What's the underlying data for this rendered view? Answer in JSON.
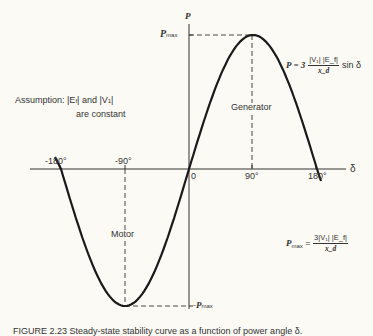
{
  "axes": {
    "y_label": "P",
    "x_label": "δ",
    "pmax_label": "P",
    "pmax_sub": "max",
    "neg_pmax_label": "-P",
    "neg_pmax_sub": "max",
    "ticks": [
      "-180°",
      "-90°",
      "0",
      "90°",
      "180°"
    ]
  },
  "annotations": {
    "assumption_line1": "Assumption:  |E",
    "assumption_f": "f",
    "assumption_mid": "| and |V",
    "assumption_1": "1",
    "assumption_end": "|",
    "assumption_line2": "are constant",
    "generator": "Generator",
    "motor": "Motor"
  },
  "equations": {
    "power_lhs": "P = 3",
    "power_num": "|V₁| |E_f|",
    "power_den": "x_d",
    "power_rhs": "sin δ",
    "pmax_lhs": "P",
    "pmax_sub": "max",
    "pmax_eq": " = ",
    "pmax_num": "3|V₁| |E_f|",
    "pmax_den": "x_d"
  },
  "caption": "FIGURE 2.23  Steady-state stability curve as a function of power angle δ.",
  "chart_data": {
    "type": "line",
    "title": "",
    "xlabel": "δ",
    "ylabel": "P",
    "x": [
      -180,
      -135,
      -90,
      -45,
      0,
      45,
      90,
      135,
      180
    ],
    "series": [
      {
        "name": "P = 3|V1||Ef|/xd sin δ (normalized to Pmax)",
        "values": [
          0,
          -0.707,
          -1,
          -0.707,
          0,
          0.707,
          1,
          0.707,
          0
        ]
      }
    ],
    "xlim": [
      -190,
      200
    ],
    "ylim": [
      -1,
      1
    ],
    "regions": [
      {
        "label": "Generator",
        "range": [
          0,
          180
        ]
      },
      {
        "label": "Motor",
        "range": [
          -180,
          0
        ]
      }
    ],
    "grid": false
  }
}
